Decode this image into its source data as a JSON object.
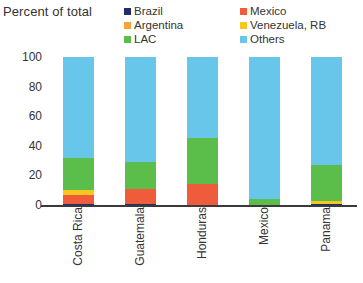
{
  "chart": {
    "axis_title": "Percent of total",
    "ylabel": "Percent of total"
  },
  "legend": {
    "columns": [
      {
        "items": [
          {
            "label": "Brazil",
            "color": "#1f2d6e",
            "key": "brazil"
          },
          {
            "label": "Argentina",
            "color": "#f5a43c",
            "key": "argentina"
          },
          {
            "label": "LAC",
            "color": "#5bbd4a",
            "key": "lac"
          }
        ]
      },
      {
        "items": [
          {
            "label": "Mexico",
            "color": "#ef5c3c",
            "key": "mexico"
          },
          {
            "label": "Venezuela, RB",
            "color": "#f7c620",
            "key": "venezuela"
          },
          {
            "label": "Others",
            "color": "#67c6ea",
            "key": "others"
          }
        ]
      }
    ]
  },
  "chart_data": {
    "type": "bar",
    "stacked": true,
    "title": "",
    "xlabel": "",
    "ylabel": "Percent of total",
    "ylim": [
      0,
      100
    ],
    "yticks": [
      100,
      80,
      60,
      40,
      20,
      0
    ],
    "grid": false,
    "legend_position": "top",
    "categories": [
      "Costa Rica",
      "Guatemala",
      "Honduras",
      "Mexico",
      "Panama"
    ],
    "series": [
      {
        "name": "Brazil",
        "color": "#1f2d6e",
        "values": [
          1,
          1,
          0,
          0,
          1
        ]
      },
      {
        "name": "Mexico",
        "color": "#ef5c3c",
        "values": [
          6,
          10,
          14,
          0,
          0
        ]
      },
      {
        "name": "Venezuela, RB",
        "color": "#f7c620",
        "values": [
          3,
          0,
          0,
          0,
          2
        ]
      },
      {
        "name": "Argentina",
        "color": "#f5a43c",
        "values": [
          0,
          0,
          0,
          0,
          0
        ]
      },
      {
        "name": "LAC",
        "color": "#5bbd4a",
        "values": [
          22,
          18,
          31,
          4,
          24
        ]
      },
      {
        "name": "Others",
        "color": "#67c6ea",
        "values": [
          68,
          71,
          55,
          96,
          73
        ]
      }
    ]
  }
}
